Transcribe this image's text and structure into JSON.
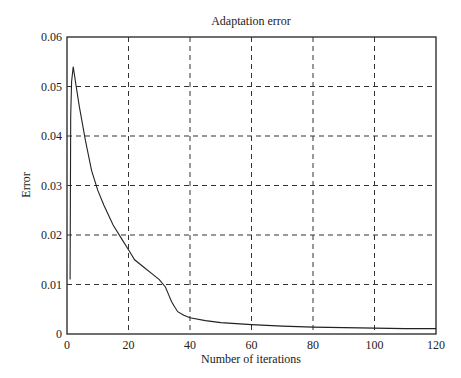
{
  "chart_data": {
    "type": "line",
    "title": "Adaptation error",
    "xlabel": "Number of iterations",
    "ylabel": "Error",
    "xlim": [
      0,
      120
    ],
    "ylim": [
      0,
      0.06
    ],
    "grid": true,
    "legend": null,
    "x_ticks": [
      "0",
      "20",
      "40",
      "60",
      "80",
      "100",
      "120"
    ],
    "y_ticks": [
      "0",
      "0.01",
      "0.02",
      "0.03",
      "0.04",
      "0.05",
      "0.06"
    ],
    "series": [
      {
        "name": "Adaptation error",
        "x": [
          1,
          1.2,
          1.5,
          2,
          3,
          4,
          6,
          8,
          10,
          12,
          15,
          18,
          20,
          22,
          25,
          28,
          30,
          32,
          33,
          34,
          35,
          36,
          38,
          40,
          45,
          50,
          60,
          70,
          80,
          90,
          100,
          110,
          120
        ],
        "y": [
          0.011,
          0.044,
          0.051,
          0.054,
          0.05,
          0.046,
          0.039,
          0.033,
          0.029,
          0.026,
          0.022,
          0.019,
          0.017,
          0.015,
          0.0135,
          0.012,
          0.011,
          0.0095,
          0.008,
          0.0065,
          0.0055,
          0.0045,
          0.0038,
          0.0033,
          0.0027,
          0.0023,
          0.0019,
          0.0016,
          0.0014,
          0.0013,
          0.0012,
          0.0011,
          0.0011
        ]
      }
    ]
  }
}
